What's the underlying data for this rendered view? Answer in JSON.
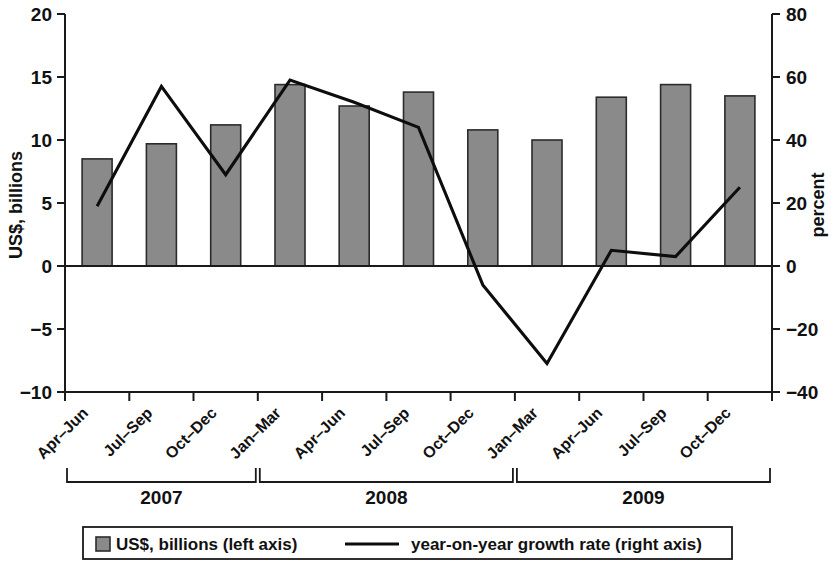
{
  "chart_data": {
    "type": "bar",
    "title": "",
    "subtitle": "",
    "xlabel": "",
    "ylabel": "US$, billions",
    "y2label": "percent",
    "grid": false,
    "legend_position": "bottom",
    "ylim": [
      -10,
      20
    ],
    "y2lim": [
      -40,
      80
    ],
    "ytick_labels": [
      "20",
      "15",
      "10",
      "5",
      "0",
      "−5",
      "−10"
    ],
    "ytick_values": [
      20,
      15,
      10,
      5,
      0,
      -5,
      -10
    ],
    "y2tick_labels": [
      "80",
      "60",
      "40",
      "20",
      "0",
      "−20",
      "−40"
    ],
    "y2tick_values": [
      80,
      60,
      40,
      20,
      0,
      -20,
      -40
    ],
    "categories": [
      "Apr–Jun",
      "Jul–Sep",
      "Oct–Dec",
      "Jan–Mar",
      "Apr–Jun",
      "Jul–Sep",
      "Oct–Dec",
      "Jan–Mar",
      "Apr–Jun",
      "Jul–Sep",
      "Oct–Dec"
    ],
    "group_labels": [
      "2007",
      "2008",
      "2009"
    ],
    "group_spans": [
      3,
      4,
      4
    ],
    "series": [
      {
        "name": "US$, billions (left axis)",
        "type": "bar",
        "axis": "left",
        "color": "#8a8a8a",
        "values": [
          8.5,
          9.7,
          11.2,
          14.4,
          12.7,
          13.8,
          10.8,
          10.0,
          13.4,
          14.4,
          13.5
        ]
      },
      {
        "name": "year-on-year growth rate (right axis)",
        "type": "line",
        "axis": "right",
        "color": "#0d0d0d",
        "values": [
          19,
          57,
          29,
          59,
          52,
          44,
          -6,
          -31,
          5,
          3,
          25
        ]
      }
    ]
  },
  "legend": {
    "entries": [
      {
        "label": "US$, billions (left axis)",
        "marker": "square",
        "color": "#8a8a8a"
      },
      {
        "label": "year-on-year growth rate (right axis)",
        "marker": "line",
        "color": "#0d0d0d"
      }
    ]
  }
}
